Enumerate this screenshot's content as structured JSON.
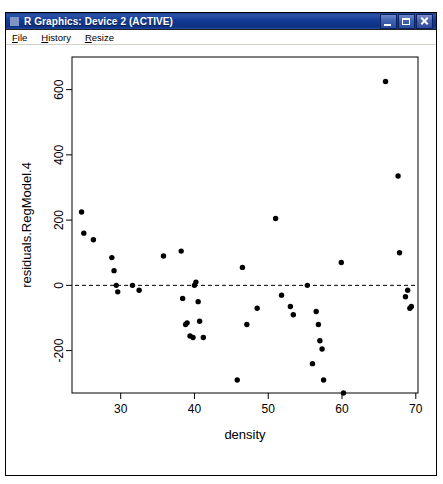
{
  "window": {
    "title": "R Graphics: Device 2 (ACTIVE)",
    "icon": "r-graphics-icon",
    "controls": {
      "minimize": "Minimize",
      "maximize": "Maximize",
      "close": "Close"
    }
  },
  "menubar": {
    "items": [
      {
        "label": "File",
        "accel": "F"
      },
      {
        "label": "History",
        "accel": "H"
      },
      {
        "label": "Resize",
        "accel": "R"
      }
    ]
  },
  "chart_data": {
    "type": "scatter",
    "title": "",
    "xlabel": "density",
    "ylabel": "residuals.RegModel.4",
    "xlim": [
      23.4,
      70.3
    ],
    "ylim": [
      -330,
      700
    ],
    "xticks": [
      30,
      40,
      50,
      60,
      70
    ],
    "yticks": [
      -200,
      0,
      200,
      400,
      600
    ],
    "grid": false,
    "legend": null,
    "point_color": "#000000",
    "point_symbol": "filled-circle",
    "annotations": [
      {
        "type": "hline",
        "value": 0,
        "style": "dashed",
        "color": "#000000",
        "label": "zero residual reference line"
      }
    ],
    "series": [
      {
        "name": "residuals.RegModel.4",
        "x": [
          24.7,
          25.0,
          26.3,
          28.8,
          29.1,
          29.4,
          29.6,
          31.6,
          32.5,
          35.8,
          38.2,
          38.4,
          38.8,
          39.0,
          39.4,
          39.8,
          40.0,
          40.2,
          40.5,
          40.7,
          41.2,
          45.8,
          46.5,
          47.1,
          48.5,
          51.0,
          51.8,
          53.0,
          53.4,
          55.3,
          56.0,
          56.5,
          56.8,
          57.0,
          57.3,
          57.5,
          59.9,
          60.2,
          65.9,
          67.6,
          67.8,
          68.6,
          68.9,
          69.2,
          69.4
        ],
        "y": [
          225,
          160,
          140,
          85,
          45,
          0,
          -20,
          0,
          -15,
          90,
          105,
          -40,
          -120,
          -115,
          -155,
          -160,
          0,
          10,
          -50,
          -110,
          -160,
          -290,
          55,
          -120,
          -70,
          205,
          -30,
          -65,
          -90,
          0,
          -240,
          -80,
          -120,
          -170,
          -195,
          -290,
          70,
          -330,
          625,
          335,
          100,
          -35,
          -15,
          -70,
          -65
        ]
      }
    ]
  }
}
